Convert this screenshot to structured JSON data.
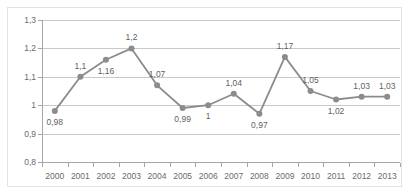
{
  "chart_data": {
    "type": "line",
    "title": "",
    "subtitle": "",
    "xlabel": "",
    "ylabel": "",
    "categories": [
      "2000",
      "2001",
      "2002",
      "2003",
      "2004",
      "2005",
      "2006",
      "2007",
      "2008",
      "2009",
      "2010",
      "2011",
      "2012",
      "2013"
    ],
    "values": [
      0.98,
      1.1,
      1.16,
      1.2,
      1.07,
      0.99,
      1,
      1.04,
      0.97,
      1.17,
      1.05,
      1.02,
      1.03,
      1.03
    ],
    "point_labels": [
      "0,98",
      "1,1",
      "1,16",
      "1,2",
      "1,07",
      "0,99",
      "1",
      "1,04",
      "0,97",
      "1,17",
      "1,05",
      "1,02",
      "1,03",
      "1,03"
    ],
    "label_positions": [
      "below",
      "above",
      "below",
      "above",
      "above",
      "below",
      "below",
      "above",
      "below",
      "above",
      "above",
      "below",
      "above",
      "above"
    ],
    "ylim": [
      0.8,
      1.3
    ],
    "ytick_values": [
      0.8,
      0.9,
      1,
      1.1,
      1.2,
      1.3
    ],
    "ytick_labels": [
      "0,8",
      "0,9",
      "1",
      "1,1",
      "1,2",
      "1,3"
    ],
    "grid": true,
    "legend": false,
    "legend_position": "none",
    "series_color": "#8c8c8c",
    "grid_color": "#c9c9c9",
    "axis_color": "#a6a6a6",
    "text_color": "#6b6b6b",
    "background_color": "#ffffff"
  },
  "watermark": {
    "text": ""
  }
}
